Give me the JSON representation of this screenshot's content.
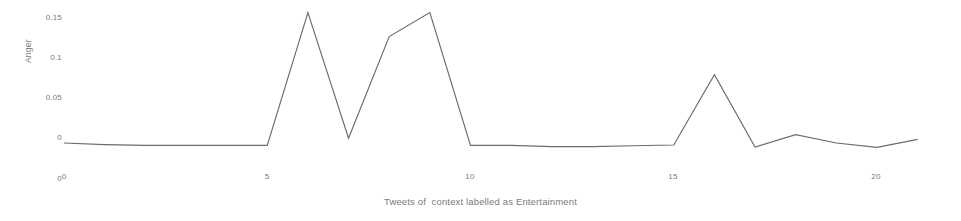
{
  "chart_data": {
    "type": "line",
    "title": "",
    "xlabel": "Tweets of  context labelled as Entertainment",
    "ylabel": "Anger",
    "x": [
      0,
      1,
      2,
      3,
      4,
      5,
      6,
      7,
      8,
      9,
      10,
      11,
      12,
      13,
      14,
      15,
      16,
      17,
      18,
      19,
      20,
      21
    ],
    "values": [
      -0.0075,
      -0.0095,
      -0.0105,
      -0.0105,
      -0.0105,
      -0.0105,
      0.1555,
      -0.0015,
      0.1255,
      0.1555,
      -0.0105,
      -0.0105,
      -0.012,
      -0.012,
      -0.011,
      -0.01,
      0.078,
      -0.0125,
      0.003,
      -0.0075,
      -0.013,
      -0.003
    ],
    "series": [
      {
        "name": "Anger",
        "values": [
          -0.0075,
          -0.0095,
          -0.0105,
          -0.0105,
          -0.0105,
          -0.0105,
          0.1555,
          -0.0015,
          0.1255,
          0.1555,
          -0.0105,
          -0.0105,
          -0.012,
          -0.012,
          -0.011,
          -0.01,
          0.078,
          -0.0125,
          0.003,
          -0.0075,
          -0.013,
          -0.003
        ]
      }
    ],
    "xticks": [
      0,
      5,
      10,
      15,
      20
    ],
    "xtick_labels": [
      "0",
      "5",
      "10",
      "15",
      "20"
    ],
    "yticks": [
      0,
      0.05,
      0.1,
      0.15
    ],
    "ytick_labels": [
      "0",
      "0.05",
      "0.1",
      "0.15"
    ],
    "extra_ytick_label": "0",
    "xlim": [
      0,
      21.6
    ],
    "ylim": [
      -0.0185,
      0.168
    ],
    "grid": false,
    "legend": "none",
    "line_color": "#6b6b6b",
    "text_color": "#7a7a7a",
    "background_color": "#ffffff"
  }
}
